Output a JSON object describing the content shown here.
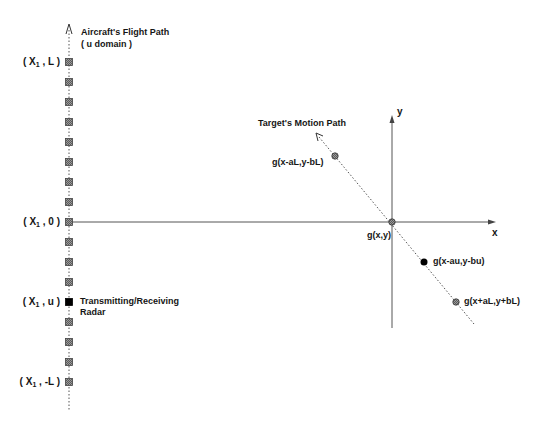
{
  "diagram": {
    "aircraft_path": {
      "title_line1": "Aircraft's Flight Path",
      "title_line2": "( u domain )",
      "x": 69,
      "y_top": 24,
      "y_bottom": 410,
      "square_fill": "#777777",
      "radar_fill": "#000000",
      "square_ys": [
        62,
        82,
        102,
        122,
        142,
        162,
        182,
        202,
        222,
        242,
        262,
        282,
        302,
        322,
        342,
        362,
        382
      ],
      "radar_index": 12
    },
    "coord_labels": [
      {
        "pre": "( X",
        "sub": "1",
        "post": " , L )",
        "y": 62
      },
      {
        "pre": "( X",
        "sub": "1",
        "post": " , 0 )",
        "y": 222
      },
      {
        "pre": "( X",
        "sub": "1",
        "post": " , u )",
        "y": 302
      },
      {
        "pre": "( X",
        "sub": "1",
        "post": " , -L )",
        "y": 382
      }
    ],
    "radar_label_line1": "Transmitting/Receiving",
    "radar_label_line2": "Radar",
    "axes": {
      "origin": [
        392,
        222
      ],
      "x_label": "x",
      "y_label": "y",
      "x_end": 496,
      "y_top": 115,
      "y_bottom": 328,
      "line_color": "#555555"
    },
    "target_path": {
      "title": "Target's Motion Path",
      "start": [
        317,
        134
      ],
      "end": [
        474,
        324
      ],
      "points": [
        {
          "label": "g(x-aL,y-bL)",
          "x": 335,
          "y": 156,
          "style": "hatched"
        },
        {
          "label": "g(x,y)",
          "x": 392,
          "y": 222,
          "style": "hatched"
        },
        {
          "label": "g(x-au,y-bu)",
          "x": 424,
          "y": 262,
          "style": "solid"
        },
        {
          "label": "g(x+aL,y+bL)",
          "x": 456,
          "y": 302,
          "style": "hatched"
        }
      ]
    }
  }
}
